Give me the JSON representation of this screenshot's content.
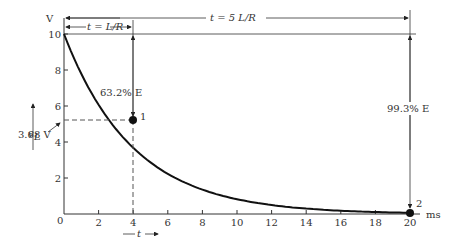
{
  "chart_data": {
    "type": "line",
    "title": "",
    "xlabel": "t",
    "ylabel": "v_L",
    "x_unit": "ms",
    "y_unit": "V",
    "xlim": [
      0,
      20
    ],
    "ylim": [
      0,
      10
    ],
    "x_ticks": [
      "0",
      "2",
      "4",
      "6",
      "8",
      "10",
      "12",
      "14",
      "16",
      "18",
      "20"
    ],
    "y_ticks": [
      "2",
      "4",
      "6",
      "8",
      "10"
    ],
    "series": [
      {
        "name": "v_L",
        "x": [
          0,
          1,
          2,
          3,
          4,
          5,
          6,
          8,
          10,
          12,
          14,
          16,
          18,
          20
        ],
        "y": [
          10,
          7.79,
          6.07,
          4.72,
          3.68,
          2.87,
          2.23,
          1.35,
          0.82,
          0.5,
          0.3,
          0.18,
          0.11,
          0.07
        ]
      }
    ],
    "points": [
      {
        "label": "1",
        "x": 4,
        "y": 3.68
      },
      {
        "label": "2",
        "x": 20,
        "y": 0.07
      }
    ],
    "annotations": {
      "tau": "t = L/R",
      "five_tau": "t = 5 L/R",
      "drop_63": "63.2% E",
      "drop_99": "99.3% E",
      "v_at_tau": "3.68 V"
    },
    "grid": false
  },
  "labels": {
    "y_unit": "V",
    "x_unit": "ms",
    "y_axis": "v",
    "y_axis_sub": "L",
    "x_axis": "t",
    "origin": "0"
  }
}
